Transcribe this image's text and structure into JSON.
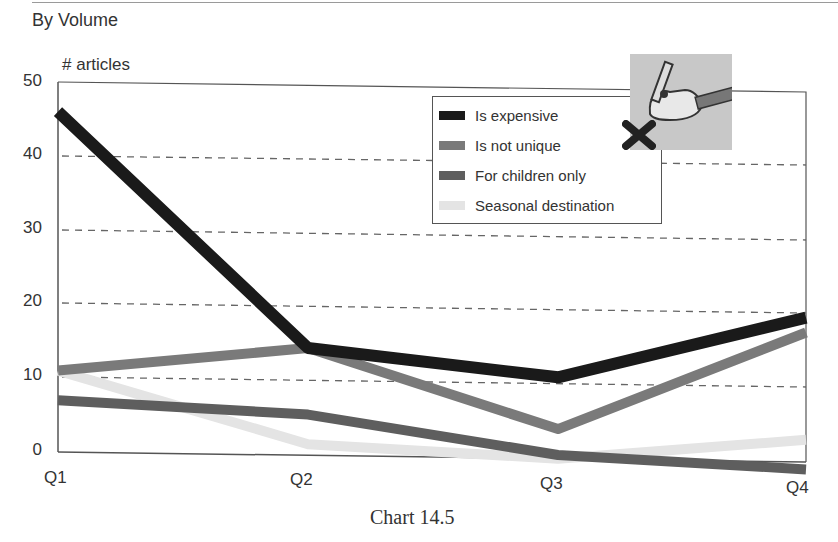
{
  "header": {
    "subtitle": "By Volume"
  },
  "caption": "Chart 14.5",
  "chart_data": {
    "type": "line",
    "title": "",
    "subtitle": "By Volume",
    "caption": "Chart 14.5",
    "xlabel": "",
    "ylabel": "# articles",
    "categories": [
      "Q1",
      "Q2",
      "Q3",
      "Q4"
    ],
    "ylim": [
      0,
      50
    ],
    "yticks": [
      "0",
      "10",
      "20",
      "30",
      "40",
      "50"
    ],
    "grid": "horizontal dashed",
    "legend_position": "upper right (inside plot)",
    "series": [
      {
        "name": "Is expensive",
        "color": "#1a1a1a",
        "values": [
          46,
          14.5,
          11,
          19.5
        ]
      },
      {
        "name": "Is not unique",
        "color": "#7a7a7a",
        "values": [
          11,
          14.5,
          4,
          17.5
        ]
      },
      {
        "name": "For children only",
        "color": "#5e5e5e",
        "values": [
          7,
          5.5,
          0.5,
          -1
        ]
      },
      {
        "name": "Seasonal destination",
        "color": "#e4e4e4",
        "values": [
          11,
          1.5,
          0,
          3
        ]
      }
    ]
  },
  "legend": {
    "items": [
      {
        "label": "Is expensive",
        "color": "#1a1a1a"
      },
      {
        "label": "Is not unique",
        "color": "#7a7a7a"
      },
      {
        "label": "For children only",
        "color": "#5e5e5e"
      },
      {
        "label": "Seasonal destination",
        "color": "#e4e4e4"
      }
    ]
  },
  "axis": {
    "ylabel": "# articles",
    "yticks": [
      "50",
      "40",
      "30",
      "20",
      "10",
      "0"
    ],
    "xticks": [
      "Q1",
      "Q2",
      "Q3",
      "Q4"
    ]
  },
  "decoration": {
    "clipart": "hand-writing-with-pen-icon",
    "mark": "x-mark-icon"
  }
}
